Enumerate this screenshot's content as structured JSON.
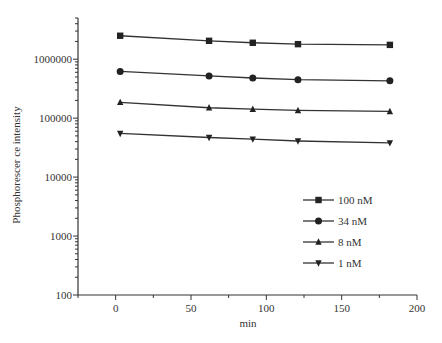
{
  "chart_data": {
    "type": "line",
    "title": "",
    "xlabel": "min",
    "ylabel": "Phosphorescer ce intensity",
    "yscale": "log",
    "xlim": [
      -25,
      200
    ],
    "ylim": [
      100,
      5000000
    ],
    "x_ticks": [
      0,
      50,
      100,
      150,
      200
    ],
    "y_ticks": [
      100,
      1000,
      10000,
      100000,
      1000000
    ],
    "y_tick_labels": [
      "100",
      "1000",
      "10000",
      "100000",
      "1000000"
    ],
    "x_tick_labels": [
      "0",
      "50",
      "100",
      "150",
      "200"
    ],
    "grid": false,
    "legend_position": "lower right inside",
    "x": [
      3,
      62,
      91,
      121,
      182
    ],
    "series": [
      {
        "name": "100 nM",
        "marker": "square",
        "values": [
          2500000,
          2050000,
          1900000,
          1800000,
          1750000
        ]
      },
      {
        "name": "34 nM",
        "marker": "circle",
        "values": [
          620000,
          520000,
          480000,
          450000,
          430000
        ]
      },
      {
        "name": "8 nM",
        "marker": "triangle-up",
        "values": [
          185000,
          150000,
          142000,
          135000,
          130000
        ]
      },
      {
        "name": "1 nM",
        "marker": "triangle-down",
        "values": [
          55000,
          47000,
          44000,
          41000,
          38000
        ]
      }
    ]
  }
}
